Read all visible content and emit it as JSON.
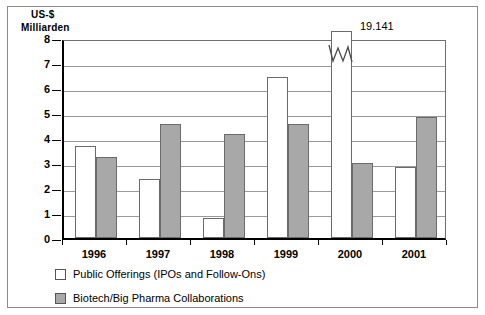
{
  "chart_data": {
    "type": "bar",
    "title": "",
    "subtitle": "",
    "xlabel": "",
    "ylabel": "US-$ Milliarden",
    "ylabel_lines": [
      "US-$",
      "Milliarden"
    ],
    "categories": [
      "1996",
      "1997",
      "1998",
      "1999",
      "2000",
      "2001"
    ],
    "ylim": [
      0,
      8
    ],
    "yticks": [
      0,
      1,
      2,
      3,
      4,
      5,
      6,
      7,
      8
    ],
    "ytick_labels": [
      "0",
      "1",
      "2",
      "3",
      "4",
      "5",
      "6",
      "7",
      "8"
    ],
    "grid": true,
    "grid_axis": "y",
    "legend_position": "below-axes-left",
    "series": [
      {
        "name": "Public Offerings (IPOs and Follow-Ons)",
        "color": "#ffffff",
        "edge_color": "#6b6b6b",
        "values": [
          3.7,
          2.35,
          0.8,
          6.45,
          19.141,
          2.85
        ],
        "clipped": [
          false,
          false,
          false,
          false,
          true,
          false
        ],
        "point_labels": [
          "",
          "",
          "",
          "",
          "19.141",
          ""
        ]
      },
      {
        "name": "Biotech/Big Pharma Collaborations",
        "color": "#a8a8a8",
        "edge_color": "#6b6b6b",
        "values": [
          3.25,
          4.55,
          4.15,
          4.55,
          3.0,
          4.85
        ],
        "clipped": [
          false,
          false,
          false,
          false,
          false,
          false
        ],
        "point_labels": [
          "",
          "",
          "",
          "",
          "",
          ""
        ]
      }
    ],
    "annotations": [
      {
        "text": "19.141",
        "series": "Public Offerings (IPOs and Follow-Ons)",
        "category": "2000",
        "note": "value label for bar truncated by axis break"
      }
    ],
    "axis_break": {
      "present": true,
      "series": "Public Offerings (IPOs and Follow-Ons)",
      "category": "2000",
      "symbol": "zigzag"
    }
  },
  "legend": {
    "items": [
      {
        "label": "Public Offerings (IPOs and Follow-Ons)",
        "swatch": "white"
      },
      {
        "label": "Biotech/Big Pharma Collaborations",
        "swatch": "gray"
      }
    ]
  },
  "colors": {
    "background": "#ffffff",
    "axis": "#000000",
    "gridline": "#9a9a9a",
    "bar_public_offerings": "#ffffff",
    "bar_collaborations": "#a8a8a8",
    "bar_edge": "#6b6b6b",
    "outer_border": "#8c8c8c",
    "text": "#000000"
  }
}
